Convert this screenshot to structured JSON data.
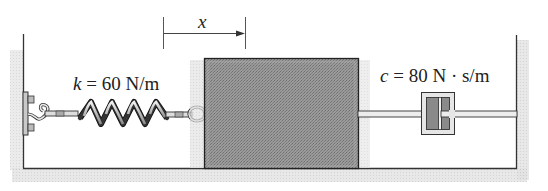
{
  "figure": {
    "type": "mass-spring-damper system",
    "displacement_label": "x",
    "spring": {
      "symbol": "k",
      "equals": " = ",
      "value": "60 N/m"
    },
    "damper": {
      "symbol": "c",
      "equals": " = ",
      "value": "80 N · s/m"
    },
    "colors": {
      "block_fill": "#8f8f8f",
      "wall_line": "#333333",
      "shadow": "#d4d4d4",
      "damper_fill": "#8a8a8a",
      "damper_casing": "#e6e6e6"
    }
  }
}
